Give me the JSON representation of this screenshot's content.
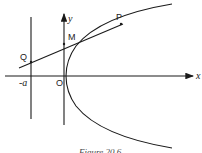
{
  "figure": {
    "caption": "Figure 20.6",
    "axes": {
      "x_label": "x",
      "y_label": "y"
    },
    "points": {
      "P": "P",
      "M": "M",
      "Q": "Q",
      "O": "O",
      "minus_a": "-a"
    },
    "elements": [
      "parabola",
      "directrix",
      "tangent line through P",
      "x-axis",
      "y-axis"
    ]
  }
}
